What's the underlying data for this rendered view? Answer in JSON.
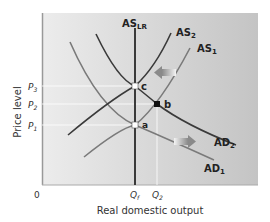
{
  "diagram": {
    "y_axis_label": "Price level",
    "x_axis_label": "Real domestic output",
    "origin_label": "0",
    "price_ticks": [
      {
        "label": "P",
        "sub": "3"
      },
      {
        "label": "P",
        "sub": "2"
      },
      {
        "label": "P",
        "sub": "1"
      }
    ],
    "output_ticks": [
      {
        "label": "Q",
        "sub": "f"
      },
      {
        "label": "Q",
        "sub": "2"
      }
    ],
    "curves": {
      "as_lr": {
        "label": "AS",
        "sub": "LR"
      },
      "as2": {
        "label": "AS",
        "sub": "2"
      },
      "as1": {
        "label": "AS",
        "sub": "1"
      },
      "ad2": {
        "label": "AD",
        "sub": "2"
      },
      "ad1": {
        "label": "AD",
        "sub": "1"
      }
    },
    "points": {
      "a": "a",
      "b": "b",
      "c": "c"
    },
    "colors": {
      "plot_bg_left": "#e6e6e6",
      "plot_bg_right": "#c8c8c8",
      "dark_curve": "#3a3a3a",
      "light_curve": "#7a7a7a",
      "arrow": "#8c8c8c"
    }
  }
}
